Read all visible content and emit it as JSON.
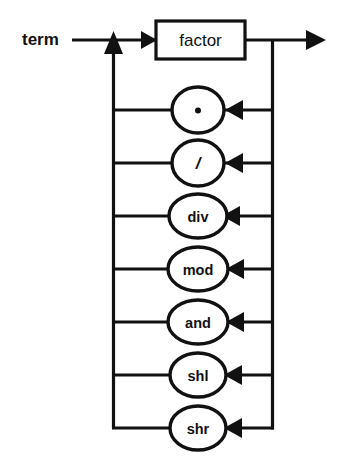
{
  "diagram": {
    "kind": "railroad-syntax-diagram",
    "entry_label": "term",
    "exit_arrow": true,
    "primary_node": {
      "label": "factor",
      "shape": "box"
    },
    "loop_operators": [
      {
        "label": "·",
        "shape": "circle",
        "style": "symbol",
        "name": "multiply"
      },
      {
        "label": "/",
        "shape": "circle",
        "style": "symbol-italic",
        "name": "divide"
      },
      {
        "label": "div",
        "shape": "oval",
        "style": "word",
        "name": "div"
      },
      {
        "label": "mod",
        "shape": "oval",
        "style": "word",
        "name": "mod"
      },
      {
        "label": "and",
        "shape": "oval",
        "style": "word",
        "name": "and"
      },
      {
        "label": "shl",
        "shape": "oval",
        "style": "word",
        "name": "shl"
      },
      {
        "label": "shr",
        "shape": "oval",
        "style": "word",
        "name": "shr"
      }
    ],
    "colors": {
      "line": "#111111",
      "background": "#ffffff",
      "node_fill": "#ffffff"
    }
  }
}
